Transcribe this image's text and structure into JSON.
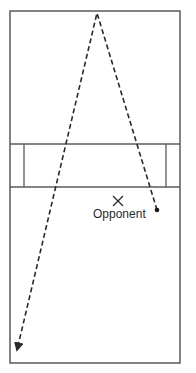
{
  "diagram": {
    "type": "court-shot-path",
    "colors": {
      "lines": "#5a5a5a",
      "path": "#2a2a2a",
      "background": "#ffffff"
    },
    "court": {
      "outer": {
        "x1": 10,
        "y1": 11,
        "x2": 180,
        "y2": 363
      },
      "service_band": {
        "y_top": 144,
        "y_bottom": 187
      },
      "inner_left_x": 24,
      "inner_right_x": 166
    },
    "shot_path": {
      "style": "dashed",
      "points": [
        [
          157,
          210
        ],
        [
          97,
          13
        ],
        [
          17,
          350
        ]
      ],
      "start_marker": "dot",
      "end_marker": "arrowhead"
    },
    "opponent": {
      "marker": "X",
      "position": [
        118,
        201
      ],
      "label": "Opponent"
    }
  }
}
